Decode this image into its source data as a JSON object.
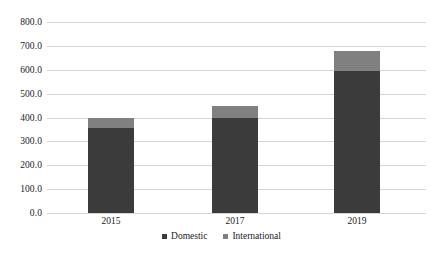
{
  "chart_data": {
    "type": "bar",
    "subtype": "stacked-column",
    "title": "",
    "xlabel": "",
    "ylabel": "",
    "categories": [
      "2015",
      "2017",
      "2019"
    ],
    "series": [
      {
        "name": "Domestic",
        "color": "#3b3b3b",
        "values": [
          355,
          400,
          595
        ]
      },
      {
        "name": "International",
        "color": "#808080",
        "values": [
          45,
          50,
          85
        ]
      }
    ],
    "totals": [
      400,
      450,
      680
    ],
    "ylim": [
      0,
      800
    ],
    "ytick_step": 100,
    "ytick_labels": [
      "800.0",
      "700.0",
      "600.0",
      "500.0",
      "400.0",
      "300.0",
      "200.0",
      "100.0",
      "0.0"
    ],
    "ytick_values": [
      800,
      700,
      600,
      500,
      400,
      300,
      200,
      100,
      0
    ],
    "grid": true,
    "grid_axis": "y",
    "legend_position": "bottom",
    "legend_entries": [
      "Domestic",
      "International"
    ],
    "background_color": "#ffffff",
    "gridline_color": "#d4d4d4"
  }
}
